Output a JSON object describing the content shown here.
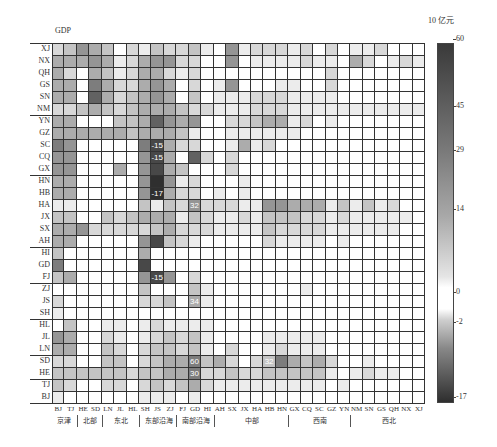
{
  "chart_data": {
    "type": "heatmap",
    "title": "GDP",
    "unit_label": "10 亿元",
    "rows": [
      "XJ",
      "NX",
      "QH",
      "GS",
      "SN",
      "NM",
      "YN",
      "GZ",
      "SC",
      "CQ",
      "GX",
      "HN",
      "HB",
      "HA",
      "JX",
      "SX",
      "AH",
      "HI",
      "GD",
      "FJ",
      "ZJ",
      "JS",
      "SH",
      "HL",
      "JL",
      "LN",
      "SD",
      "HE",
      "TJ",
      "BJ"
    ],
    "columns": [
      "BJ",
      "TJ",
      "HE",
      "SD",
      "LN",
      "JL",
      "HL",
      "SH",
      "JS",
      "ZJ",
      "FJ",
      "GD",
      "HI",
      "AH",
      "SX",
      "JX",
      "HA",
      "HB",
      "HN",
      "GX",
      "CQ",
      "SC",
      "GZ",
      "YN",
      "NM",
      "SN",
      "GS",
      "QH",
      "NX",
      "XJ"
    ],
    "column_groups": [
      {
        "label": "京津",
        "span": 2
      },
      {
        "label": "北部",
        "span": 2
      },
      {
        "label": "东北",
        "span": 3
      },
      {
        "label": "东部沿海",
        "span": 3
      },
      {
        "label": "南部沿海",
        "span": 3
      },
      {
        "label": "中部",
        "span": 6
      },
      {
        "label": "西南",
        "span": 5
      },
      {
        "label": "西北",
        "span": 6
      }
    ],
    "row_group_breaks_after": [
      "NM",
      "GX",
      "AH",
      "FJ",
      "SH",
      "LN",
      "HE"
    ],
    "colorbar": {
      "min": -17,
      "max": 60,
      "ticks": [
        60,
        45,
        29,
        14,
        0,
        -2,
        -17
      ]
    },
    "annotations": [
      {
        "row": "SC",
        "col": "JS",
        "value": -15
      },
      {
        "row": "CQ",
        "col": "JS",
        "value": -15
      },
      {
        "row": "HB",
        "col": "JS",
        "value": -17
      },
      {
        "row": "HA",
        "col": "GD",
        "value": 32
      },
      {
        "row": "FJ",
        "col": "JS",
        "value": -15
      },
      {
        "row": "JS",
        "col": "GD",
        "value": 34
      },
      {
        "row": "SD",
        "col": "GD",
        "value": 60
      },
      {
        "row": "SD",
        "col": "HB",
        "value": 32
      },
      {
        "row": "HE",
        "col": "GD",
        "value": 30
      }
    ],
    "shade_levels_note": "approximate tone 0 (white) to 9 (darkest), negative values rendered as dark warm gray",
    "shades": [
      [
        2,
        3,
        5,
        4,
        3,
        0,
        2,
        1,
        3,
        2,
        2,
        3,
        1,
        0,
        5,
        1,
        2,
        2,
        2,
        1,
        2,
        0,
        2,
        0,
        1,
        1,
        2,
        0,
        0,
        0
      ],
      [
        4,
        4,
        4,
        5,
        4,
        1,
        2,
        4,
        5,
        5,
        2,
        2,
        0,
        0,
        5,
        0,
        1,
        1,
        1,
        1,
        2,
        1,
        1,
        0,
        4,
        2,
        0,
        1,
        2,
        1
      ],
      [
        4,
        2,
        0,
        4,
        3,
        1,
        2,
        4,
        4,
        2,
        1,
        2,
        0,
        0,
        0,
        0,
        0,
        0,
        0,
        0,
        0,
        0,
        2,
        0,
        0,
        0,
        0,
        0,
        0,
        0
      ],
      [
        4,
        4,
        0,
        6,
        4,
        2,
        2,
        4,
        5,
        4,
        0,
        2,
        0,
        1,
        5,
        0,
        0,
        0,
        1,
        1,
        0,
        0,
        2,
        0,
        0,
        0,
        0,
        0,
        0,
        0
      ],
      [
        4,
        4,
        0,
        7,
        4,
        2,
        3,
        4,
        5,
        4,
        0,
        3,
        0,
        1,
        1,
        1,
        2,
        2,
        2,
        1,
        1,
        1,
        1,
        0,
        0,
        0,
        0,
        0,
        0,
        0
      ],
      [
        2,
        2,
        3,
        4,
        3,
        2,
        3,
        4,
        4,
        4,
        3,
        2,
        2,
        1,
        1,
        1,
        2,
        2,
        2,
        1,
        1,
        1,
        1,
        1,
        1,
        1,
        1,
        1,
        1,
        1
      ],
      [
        4,
        4,
        0,
        0,
        0,
        3,
        3,
        4,
        7,
        5,
        4,
        5,
        0,
        0,
        2,
        2,
        3,
        4,
        4,
        1,
        2,
        0,
        1,
        0,
        0,
        0,
        0,
        0,
        0,
        0
      ],
      [
        4,
        4,
        4,
        4,
        4,
        4,
        3,
        4,
        4,
        4,
        3,
        1,
        0,
        0,
        1,
        1,
        1,
        1,
        1,
        1,
        0,
        0,
        0,
        0,
        0,
        0,
        0,
        0,
        0,
        0
      ],
      [
        6,
        5,
        0,
        0,
        0,
        0,
        0,
        6,
        8,
        4,
        2,
        2,
        0,
        0,
        1,
        4,
        1,
        2,
        0,
        0,
        0,
        0,
        0,
        0,
        0,
        0,
        0,
        0,
        0,
        0
      ],
      [
        5,
        5,
        0,
        0,
        0,
        0,
        0,
        5,
        8,
        4,
        0,
        7,
        2,
        0,
        2,
        0,
        0,
        0,
        0,
        0,
        0,
        0,
        0,
        0,
        0,
        0,
        0,
        0,
        0,
        0
      ],
      [
        5,
        5,
        0,
        0,
        0,
        4,
        0,
        5,
        8,
        4,
        3,
        0,
        0,
        0,
        2,
        0,
        0,
        0,
        0,
        0,
        0,
        0,
        0,
        0,
        0,
        0,
        0,
        0,
        0,
        0
      ],
      [
        4,
        4,
        0,
        0,
        0,
        0,
        0,
        5,
        9,
        5,
        1,
        2,
        0,
        0,
        0,
        1,
        0,
        0,
        0,
        0,
        0,
        0,
        0,
        0,
        0,
        0,
        0,
        0,
        0,
        0
      ],
      [
        4,
        4,
        0,
        0,
        0,
        0,
        0,
        5,
        9,
        4,
        2,
        2,
        0,
        1,
        0,
        1,
        0,
        0,
        0,
        0,
        0,
        0,
        0,
        0,
        0,
        0,
        0,
        0,
        0,
        0
      ],
      [
        1,
        1,
        0,
        0,
        0,
        0,
        0,
        3,
        1,
        3,
        2,
        5,
        2,
        2,
        2,
        1,
        1,
        5,
        5,
        4,
        4,
        4,
        1,
        3,
        1,
        3,
        1,
        2,
        0,
        0
      ],
      [
        3,
        3,
        0,
        0,
        3,
        2,
        3,
        4,
        4,
        4,
        1,
        3,
        2,
        1,
        1,
        2,
        1,
        3,
        3,
        3,
        2,
        2,
        1,
        2,
        1,
        1,
        1,
        1,
        1,
        0
      ],
      [
        4,
        4,
        5,
        2,
        2,
        2,
        2,
        2,
        3,
        4,
        2,
        2,
        2,
        1,
        1,
        1,
        1,
        3,
        2,
        2,
        2,
        2,
        1,
        1,
        1,
        1,
        1,
        1,
        0,
        0
      ],
      [
        4,
        4,
        0,
        0,
        0,
        0,
        0,
        5,
        8,
        3,
        2,
        1,
        0,
        0,
        0,
        0,
        0,
        2,
        1,
        1,
        1,
        1,
        0,
        1,
        0,
        0,
        0,
        0,
        0,
        0
      ],
      [
        3,
        0,
        0,
        0,
        0,
        0,
        0,
        4,
        0,
        0,
        0,
        0,
        0,
        0,
        0,
        0,
        0,
        0,
        0,
        0,
        0,
        0,
        0,
        0,
        0,
        0,
        0,
        0,
        0,
        0
      ],
      [
        6,
        0,
        0,
        0,
        0,
        0,
        0,
        8,
        0,
        0,
        0,
        0,
        0,
        0,
        0,
        0,
        0,
        0,
        0,
        0,
        0,
        0,
        0,
        0,
        0,
        0,
        0,
        0,
        0,
        0
      ],
      [
        3,
        4,
        0,
        0,
        0,
        0,
        0,
        5,
        8,
        5,
        0,
        2,
        0,
        0,
        0,
        0,
        0,
        0,
        0,
        0,
        0,
        0,
        0,
        0,
        0,
        0,
        0,
        0,
        0,
        0
      ],
      [
        0,
        0,
        0,
        0,
        0,
        0,
        0,
        3,
        0,
        0,
        0,
        3,
        1,
        0,
        0,
        0,
        0,
        0,
        0,
        0,
        1,
        0,
        0,
        0,
        0,
        0,
        0,
        0,
        0,
        0
      ],
      [
        2,
        0,
        0,
        0,
        0,
        0,
        0,
        2,
        2,
        3,
        0,
        4,
        1,
        0,
        0,
        0,
        0,
        0,
        0,
        0,
        0,
        0,
        0,
        0,
        0,
        0,
        0,
        0,
        0,
        0
      ],
      [
        1,
        0,
        0,
        0,
        0,
        0,
        0,
        0,
        0,
        0,
        0,
        0,
        0,
        0,
        0,
        0,
        0,
        0,
        0,
        0,
        0,
        0,
        0,
        0,
        0,
        0,
        0,
        0,
        0,
        0
      ],
      [
        0,
        3,
        0,
        0,
        1,
        1,
        0,
        1,
        2,
        1,
        1,
        1,
        1,
        0,
        0,
        0,
        0,
        0,
        0,
        0,
        0,
        0,
        0,
        0,
        0,
        0,
        0,
        0,
        0,
        0
      ],
      [
        5,
        4,
        0,
        0,
        2,
        1,
        0,
        1,
        2,
        3,
        2,
        3,
        1,
        0,
        0,
        0,
        0,
        1,
        1,
        1,
        1,
        1,
        0,
        0,
        0,
        0,
        0,
        0,
        0,
        0
      ],
      [
        4,
        4,
        0,
        0,
        3,
        2,
        0,
        2,
        3,
        3,
        2,
        3,
        1,
        0,
        2,
        0,
        0,
        1,
        2,
        1,
        1,
        1,
        0,
        0,
        0,
        0,
        0,
        0,
        0,
        0
      ],
      [
        2,
        2,
        0,
        0,
        3,
        3,
        0,
        2,
        3,
        4,
        4,
        6,
        3,
        4,
        2,
        0,
        2,
        3,
        6,
        4,
        3,
        4,
        2,
        0,
        0,
        1,
        0,
        0,
        0,
        0
      ],
      [
        3,
        3,
        3,
        3,
        3,
        3,
        2,
        3,
        3,
        4,
        4,
        6,
        2,
        2,
        3,
        2,
        2,
        3,
        3,
        3,
        3,
        3,
        1,
        0,
        1,
        2,
        1,
        1,
        0,
        0
      ],
      [
        3,
        2,
        0,
        0,
        2,
        2,
        0,
        2,
        3,
        2,
        3,
        4,
        2,
        1,
        1,
        1,
        1,
        1,
        1,
        1,
        1,
        1,
        0,
        1,
        0,
        0,
        0,
        0,
        0,
        0
      ],
      [
        1,
        0,
        0,
        0,
        0,
        0,
        0,
        1,
        1,
        1,
        0,
        1,
        0,
        0,
        0,
        0,
        0,
        0,
        0,
        0,
        0,
        0,
        0,
        0,
        0,
        0,
        0,
        0,
        0,
        0
      ]
    ]
  },
  "labels": {
    "title": "GDP",
    "unit": "10 亿元",
    "colorbar_ticks": [
      "60",
      "45",
      "29",
      "14",
      "0",
      "-2",
      "-17"
    ]
  }
}
